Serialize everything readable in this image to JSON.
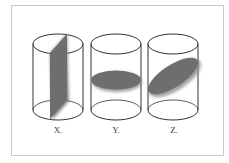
{
  "figure": {
    "panels": [
      {
        "label": "X.",
        "cross_section": "vertical-rectangle"
      },
      {
        "label": "Y.",
        "cross_section": "horizontal-ellipse"
      },
      {
        "label": "Z.",
        "cross_section": "tilted-ellipse"
      }
    ],
    "colors": {
      "outline": "#333333",
      "section_fill": "#777777",
      "frame": "#c8c8c8"
    }
  }
}
